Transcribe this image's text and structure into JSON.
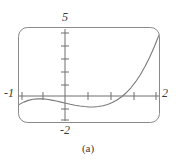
{
  "figure": {
    "caption": "(a)",
    "frame": {
      "stroke": "#8a8a8a",
      "corner_radius": 9,
      "x": 18,
      "y": 27,
      "width": 142,
      "height": 96
    },
    "axes": {
      "stroke": "#6e6e6e",
      "x_label_min": "-1",
      "x_label_max": "2",
      "y_label_max": "5",
      "y_label_min": "-2",
      "x_ticks_count": 6,
      "y_ticks_count": 7
    },
    "curve": {
      "stroke": "#7a7a7a",
      "stroke_width": 1.1
    }
  },
  "chart_data": {
    "type": "line",
    "title": "",
    "subtitle": "",
    "xlabel": "",
    "ylabel": "",
    "xlim": [
      -1,
      2
    ],
    "ylim": [
      -2,
      5
    ],
    "xticks": [
      -1,
      -0.5,
      0,
      0.5,
      1,
      1.5,
      2
    ],
    "yticks": [
      -2,
      -1,
      0,
      1,
      2,
      3,
      4,
      5
    ],
    "xticklabels": [
      "-1",
      "",
      "",
      "",
      "",
      "",
      "2"
    ],
    "yticklabels": [
      "-2",
      "",
      "",
      "",
      "",
      "",
      "",
      "5"
    ],
    "grid": false,
    "legend": null,
    "annotations": [
      "(a)"
    ],
    "series": [
      {
        "name": "cubic",
        "x": [
          -1.0,
          -0.9,
          -0.8,
          -0.7,
          -0.6,
          -0.5,
          -0.4,
          -0.3,
          -0.2,
          -0.1,
          0.0,
          0.1,
          0.2,
          0.3,
          0.4,
          0.5,
          0.6,
          0.7,
          0.8,
          0.9,
          1.0,
          1.1,
          1.2,
          1.3,
          1.4,
          1.5,
          1.6,
          1.7,
          1.8,
          1.9,
          2.0
        ],
        "y": [
          -0.7,
          -0.52,
          -0.39,
          -0.31,
          -0.28,
          -0.28,
          -0.31,
          -0.37,
          -0.44,
          -0.52,
          -0.6,
          -0.68,
          -0.75,
          -0.81,
          -0.85,
          -0.88,
          -0.88,
          -0.85,
          -0.79,
          -0.69,
          -0.55,
          -0.36,
          -0.12,
          0.18,
          0.55,
          1.0,
          1.52,
          2.13,
          2.82,
          3.6,
          4.48
        ]
      }
    ]
  }
}
